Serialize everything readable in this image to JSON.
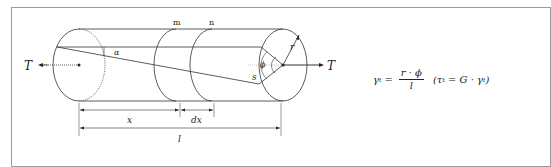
{
  "diagram": {
    "labels": {
      "torque_left": "T",
      "torque_right": "T",
      "section_m": "m",
      "section_n": "n",
      "alpha": "α",
      "phi": "ϕ",
      "radius": "r",
      "arc": "s",
      "dim_x": "x",
      "dim_dx": "dx",
      "dim_l": "l"
    },
    "colors": {
      "line": "#333333",
      "guide": "#888888",
      "frame": "#9a9a9a"
    }
  },
  "formula": {
    "lhs": "γ",
    "lhs_sub": "t",
    "equals": "=",
    "numerator": "r · ϕ",
    "denominator": "l",
    "paren_open": "(τ",
    "paren_sub": "t",
    "paren_mid": " = G · γ",
    "paren_sub2": "t",
    "paren_close": ")"
  }
}
